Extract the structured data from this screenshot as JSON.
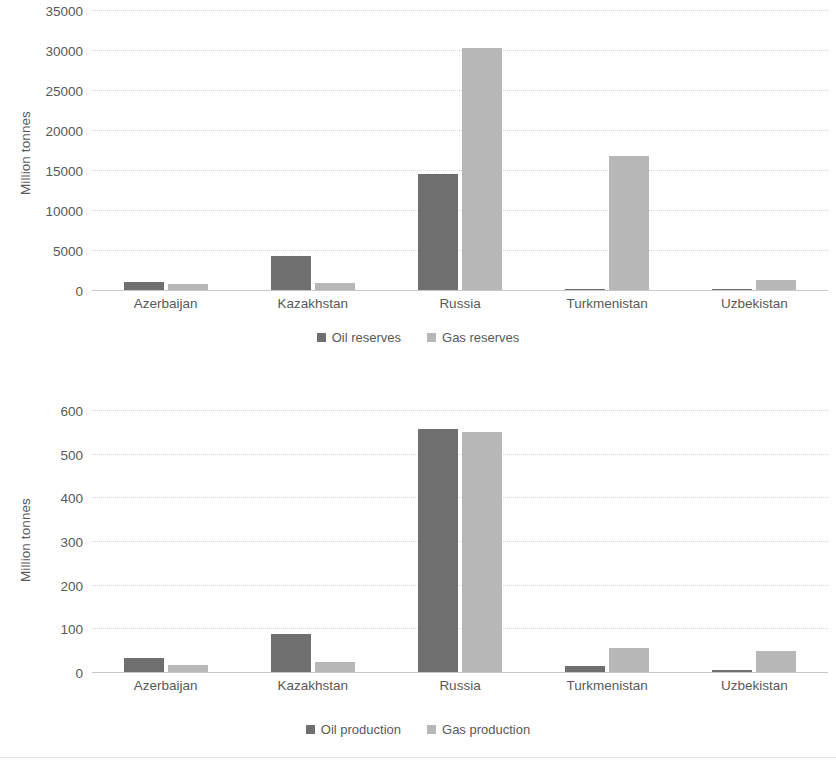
{
  "charts": [
    {
      "id": "reserves",
      "ylabel": "Million tonnes",
      "categories": [
        "Azerbaijan",
        "Kazakhstan",
        "Russia",
        "Turkmenistan",
        "Uzbekistan"
      ],
      "yticks": [
        "0",
        "5000",
        "10000",
        "15000",
        "20000",
        "25000",
        "30000",
        "35000"
      ],
      "legend": [
        "Oil reserves",
        "Gas reserves"
      ]
    },
    {
      "id": "production",
      "ylabel": "Million tonnes",
      "categories": [
        "Azerbaijan",
        "Kazakhstan",
        "Russia",
        "Turkmenistan",
        "Uzbekistan"
      ],
      "yticks": [
        "0",
        "100",
        "200",
        "300",
        "400",
        "500",
        "600"
      ],
      "legend": [
        "Oil production",
        "Gas production"
      ]
    }
  ],
  "colors": {
    "series_oil": "#6f6f6f",
    "series_gas": "#b7b7b7",
    "gridline": "#d6d6d6",
    "text": "#595959"
  },
  "chart_data": [
    {
      "type": "bar",
      "title": "",
      "xlabel": "",
      "ylabel": "Million tonnes",
      "ylim": [
        0,
        35000
      ],
      "ytick_step": 5000,
      "grid": true,
      "legend_position": "bottom",
      "categories": [
        "Azerbaijan",
        "Kazakhstan",
        "Russia",
        "Turkmenistan",
        "Uzbekistan"
      ],
      "series": [
        {
          "name": "Oil reserves",
          "color": "#6f6f6f",
          "values": [
            1000,
            4200,
            14500,
            100,
            100
          ]
        },
        {
          "name": "Gas reserves",
          "color": "#b7b7b7",
          "values": [
            700,
            900,
            30200,
            16800,
            1200
          ]
        }
      ]
    },
    {
      "type": "bar",
      "title": "",
      "xlabel": "",
      "ylabel": "Million tonnes",
      "ylim": [
        0,
        600
      ],
      "ytick_step": 100,
      "grid": true,
      "legend_position": "bottom",
      "categories": [
        "Azerbaijan",
        "Kazakhstan",
        "Russia",
        "Turkmenistan",
        "Uzbekistan"
      ],
      "series": [
        {
          "name": "Oil production",
          "color": "#6f6f6f",
          "values": [
            32,
            86,
            557,
            13,
            5
          ]
        },
        {
          "name": "Gas production",
          "color": "#b7b7b7",
          "values": [
            16,
            22,
            549,
            55,
            47
          ]
        }
      ]
    }
  ]
}
